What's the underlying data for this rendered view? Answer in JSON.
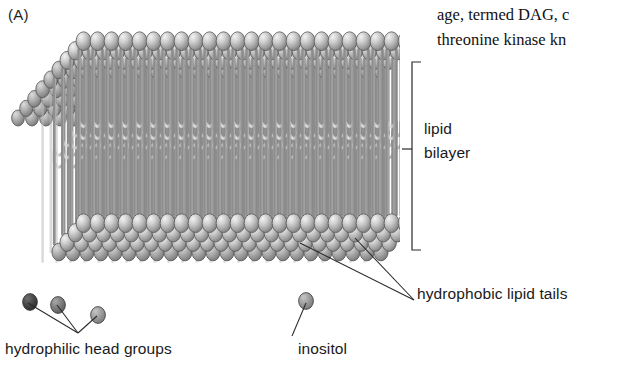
{
  "figure": {
    "panel_label": "(A)",
    "type": "lipid-bilayer-diagram",
    "palette": {
      "head_light": "#cfcfcf",
      "head_mid": "#9a9a9a",
      "head_dark": "#3d3d3d",
      "head_inositol": "#8f8f8f",
      "tail": "#b5b5b5",
      "outline": "#4a4a4a",
      "text": "#1a1a1a",
      "background": "#ffffff"
    }
  },
  "body_text": {
    "line1": "age, termed DAG, c",
    "line2": "threonine kinase kn"
  },
  "labels": {
    "bilayer_line1": "lipid",
    "bilayer_line2": "bilayer",
    "hydrophobic_tails": "hydrophobic lipid tails",
    "hydrophilic_heads": "hydrophilic head groups",
    "inositol": "inositol"
  },
  "annotations": {
    "bracket": {
      "name": "lipid-bilayer-bracket",
      "x": 412,
      "y_top": 62,
      "y_bottom": 250,
      "tick_y": 149
    },
    "leader_lines": [
      {
        "name": "tails-leader-upper",
        "x1": 300,
        "y1": 243,
        "x2": 414,
        "y2": 300
      },
      {
        "name": "tails-leader-lower",
        "x1": 355,
        "y1": 238,
        "x2": 414,
        "y2": 300
      },
      {
        "name": "heads-leader-dark",
        "x1": 28,
        "y1": 303,
        "x2": 78,
        "y2": 333
      },
      {
        "name": "heads-leader-mid",
        "x1": 57,
        "y1": 305,
        "x2": 78,
        "y2": 333
      },
      {
        "name": "heads-leader-light",
        "x1": 97,
        "y1": 316,
        "x2": 78,
        "y2": 333
      },
      {
        "name": "inositol-leader",
        "x1": 306,
        "y1": 303,
        "x2": 292,
        "y2": 336
      }
    ]
  }
}
